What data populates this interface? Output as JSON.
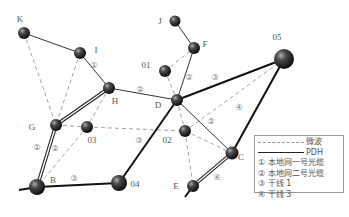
{
  "diagram": {
    "title": "",
    "nodes": [
      {
        "id": "K",
        "label": "K",
        "x": 24,
        "y": 33,
        "r": 6,
        "lx": 20,
        "ly": 22
      },
      {
        "id": "I",
        "label": "I",
        "x": 80,
        "y": 53,
        "r": 6,
        "lx": 96,
        "ly": 53
      },
      {
        "id": "H",
        "label": "H",
        "x": 109,
        "y": 88,
        "r": 6,
        "lx": 115,
        "ly": 104
      },
      {
        "id": "D",
        "label": "D",
        "x": 177,
        "y": 100,
        "r": 6,
        "lx": 158,
        "ly": 108
      },
      {
        "id": "J",
        "label": "J",
        "x": 175,
        "y": 21,
        "r": 5.5,
        "lx": 160,
        "ly": 24
      },
      {
        "id": "F",
        "label": "F",
        "x": 194,
        "y": 48,
        "r": 6,
        "lx": 205,
        "ly": 47
      },
      {
        "id": "01",
        "label": "01",
        "x": 165,
        "y": 71,
        "r": 6,
        "lx": 146,
        "ly": 68
      },
      {
        "id": "05",
        "label": "05",
        "x": 284,
        "y": 59,
        "r": 10,
        "lx": 277,
        "ly": 40
      },
      {
        "id": "G",
        "label": "G",
        "x": 56,
        "y": 125,
        "r": 6,
        "lx": 32,
        "ly": 130
      },
      {
        "id": "03",
        "label": "03",
        "x": 87,
        "y": 127,
        "r": 6,
        "lx": 92,
        "ly": 143
      },
      {
        "id": "02",
        "label": "02",
        "x": 185,
        "y": 131,
        "r": 6,
        "lx": 167,
        "ly": 143
      },
      {
        "id": "C",
        "label": "C",
        "x": 232,
        "y": 153,
        "r": 6.5,
        "lx": 241,
        "ly": 160
      },
      {
        "id": "B",
        "label": "B",
        "x": 37,
        "y": 187,
        "r": 8,
        "lx": 53,
        "ly": 183
      },
      {
        "id": "04",
        "label": "04",
        "x": 119,
        "y": 183,
        "r": 8,
        "lx": 135,
        "ly": 187
      },
      {
        "id": "E",
        "label": "E",
        "x": 193,
        "y": 186,
        "r": 6,
        "lx": 176,
        "ly": 189
      }
    ],
    "edges": [
      {
        "from": "K",
        "to": "I",
        "type": "thin",
        "label": ""
      },
      {
        "from": "I",
        "to": "H",
        "type": "thin",
        "label": "①",
        "lx": 94,
        "ly": 68
      },
      {
        "from": "H",
        "to": "D",
        "type": "thin",
        "label": "②",
        "lx": 140,
        "ly": 92
      },
      {
        "from": "J",
        "to": "F",
        "type": "thin",
        "label": ""
      },
      {
        "from": "F",
        "to": "D",
        "type": "thin",
        "label": "②",
        "lx": 189,
        "ly": 80
      },
      {
        "from": "D",
        "to": "C",
        "type": "thin",
        "label": "②",
        "lx": 211,
        "ly": 124
      },
      {
        "from": "D",
        "to": "05",
        "type": "thick",
        "label": "③",
        "lx": 215,
        "ly": 80
      },
      {
        "from": "05",
        "to": "C",
        "type": "thick",
        "label": ""
      },
      {
        "from": "D",
        "to": "04",
        "type": "thick",
        "label": "③",
        "lx": 139,
        "ly": 143
      },
      {
        "from": "B",
        "to": "04",
        "type": "thick",
        "label": "③",
        "lx": 74,
        "ly": 181
      },
      {
        "from": "B",
        "to": "G",
        "type": "double",
        "label": "①",
        "lx": 37,
        "ly": 150
      },
      {
        "from": "G",
        "to": "H",
        "type": "double",
        "label": ""
      },
      {
        "from": "C",
        "to": "E",
        "type": "double",
        "label": "④",
        "lx": 217,
        "ly": 180
      },
      {
        "from": "K",
        "to": "G",
        "type": "dashed",
        "label": ""
      },
      {
        "from": "I",
        "to": "G",
        "type": "dashed",
        "label": ""
      },
      {
        "from": "H",
        "to": "03",
        "type": "dashed",
        "label": ""
      },
      {
        "from": "G",
        "to": "03",
        "type": "dashed",
        "label": ""
      },
      {
        "from": "03",
        "to": "B",
        "type": "dashed",
        "label": "②",
        "lx": 55,
        "ly": 151
      },
      {
        "from": "03",
        "to": "02",
        "type": "dashed",
        "label": ""
      },
      {
        "from": "01",
        "to": "F",
        "type": "dashed",
        "label": ""
      },
      {
        "from": "01",
        "to": "D",
        "type": "dashed",
        "label": ""
      },
      {
        "from": "D",
        "to": "02",
        "type": "dashed",
        "label": ""
      },
      {
        "from": "02",
        "to": "C",
        "type": "dashed",
        "label": ""
      },
      {
        "from": "02",
        "to": "E",
        "type": "dashed",
        "label": ""
      },
      {
        "from": "05",
        "to": "02",
        "type": "dashed",
        "label": "④",
        "lx": 239,
        "ly": 110
      }
    ],
    "stubs": [
      {
        "from": "B",
        "dx": -18,
        "dy": 3,
        "type": "thick"
      },
      {
        "from": "E",
        "dx": -8,
        "dy": 11,
        "type": "thick"
      }
    ]
  },
  "legend": {
    "items": [
      {
        "line": "dash",
        "text": "微波"
      },
      {
        "line": "solid",
        "text": "PDH"
      },
      {
        "line": "none",
        "text": "① 本地网一号光缆"
      },
      {
        "line": "none",
        "text": "② 本地网二号光缆"
      },
      {
        "line": "none",
        "text": "③ 干线 1"
      },
      {
        "line": "none",
        "text": "④ 干线 3"
      }
    ]
  },
  "colors": {
    "node_dark": "#111111",
    "node_light": "#9a9a9a",
    "thin_line": "#333333",
    "thick_line": "#111111",
    "dashed_line": "#9a9a9a",
    "label": "#555555"
  }
}
